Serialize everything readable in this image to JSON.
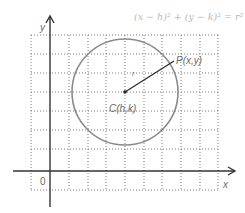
{
  "diagram": {
    "title_equation": "(x − h)² + (y − k)² = r²",
    "axes": {
      "x_label": "x",
      "y_label": "y",
      "origin_label": "0"
    },
    "circle": {
      "center_label": "C(h,k)",
      "point_label": "P(x,y)",
      "radius_label": "r"
    },
    "colors": {
      "axis": "#333333",
      "circle": "#8a8a8a",
      "radius_line": "#2a2a2a",
      "grid": "#7a7a7a",
      "equation_text": "#b8b8b8",
      "label_text": "#6a6a6a"
    }
  }
}
